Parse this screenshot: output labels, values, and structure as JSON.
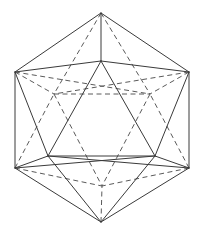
{
  "figure": {
    "type": "line-diagram",
    "canvas": {
      "width": 203,
      "height": 236,
      "background": "#ffffff"
    },
    "style": {
      "solid_color": "#3a3a3a",
      "dashed_color": "#5a5a5a",
      "stroke_width": 1,
      "dash_pattern": "5 3.5"
    },
    "vertices": {
      "outer_top_apex": {
        "x": 101,
        "y": 13
      },
      "outer_upper_left": {
        "x": 15,
        "y": 72
      },
      "outer_upper_right": {
        "x": 189,
        "y": 72
      },
      "outer_lower_left": {
        "x": 15,
        "y": 168
      },
      "outer_lower_right": {
        "x": 189,
        "y": 168
      },
      "outer_bottom_apex": {
        "x": 101,
        "y": 222
      },
      "inner_front_top": {
        "x": 101,
        "y": 61
      },
      "inner_front_left": {
        "x": 48,
        "y": 156
      },
      "inner_front_right": {
        "x": 155,
        "y": 156
      },
      "inner_back_left": {
        "x": 54,
        "y": 94
      },
      "inner_back_right": {
        "x": 150,
        "y": 94
      },
      "inner_back_bottom": {
        "x": 102,
        "y": 186
      }
    },
    "edges_solid": [
      {
        "name": "outer-hex-top-left",
        "x1": 101,
        "y1": 13,
        "x2": 15,
        "y2": 72
      },
      {
        "name": "outer-hex-top-right",
        "x1": 101,
        "y1": 13,
        "x2": 189,
        "y2": 72
      },
      {
        "name": "outer-hex-left",
        "x1": 15,
        "y1": 72,
        "x2": 15,
        "y2": 168
      },
      {
        "name": "outer-hex-right",
        "x1": 189,
        "y1": 72,
        "x2": 189,
        "y2": 168
      },
      {
        "name": "outer-hex-bottom-left",
        "x1": 15,
        "y1": 168,
        "x2": 101,
        "y2": 222
      },
      {
        "name": "outer-hex-bottom-right",
        "x1": 189,
        "y1": 168,
        "x2": 101,
        "y2": 222
      },
      {
        "name": "front-tri-left",
        "x1": 101,
        "y1": 61,
        "x2": 48,
        "y2": 156
      },
      {
        "name": "front-tri-right",
        "x1": 101,
        "y1": 61,
        "x2": 155,
        "y2": 156
      },
      {
        "name": "front-tri-base",
        "x1": 48,
        "y1": 156,
        "x2": 155,
        "y2": 156
      },
      {
        "name": "apex-to-front-top",
        "x1": 101,
        "y1": 13,
        "x2": 101,
        "y2": 61
      },
      {
        "name": "upperleft-to-front-top",
        "x1": 15,
        "y1": 72,
        "x2": 101,
        "y2": 61
      },
      {
        "name": "upperright-to-front-top",
        "x1": 189,
        "y1": 72,
        "x2": 101,
        "y2": 61
      },
      {
        "name": "upperleft-to-front-left",
        "x1": 15,
        "y1": 72,
        "x2": 48,
        "y2": 156
      },
      {
        "name": "upperright-to-front-right",
        "x1": 189,
        "y1": 72,
        "x2": 155,
        "y2": 156
      },
      {
        "name": "lowerleft-to-front-left",
        "x1": 15,
        "y1": 168,
        "x2": 48,
        "y2": 156
      },
      {
        "name": "lowerright-to-front-right",
        "x1": 189,
        "y1": 168,
        "x2": 155,
        "y2": 156
      },
      {
        "name": "lowerleft-to-front-right",
        "x1": 15,
        "y1": 168,
        "x2": 155,
        "y2": 156
      },
      {
        "name": "lowerright-to-front-left",
        "x1": 189,
        "y1": 168,
        "x2": 48,
        "y2": 156
      },
      {
        "name": "bottomapex-to-front-left",
        "x1": 101,
        "y1": 222,
        "x2": 48,
        "y2": 156
      },
      {
        "name": "bottomapex-to-front-right",
        "x1": 101,
        "y1": 222,
        "x2": 155,
        "y2": 156
      }
    ],
    "edges_dashed": [
      {
        "name": "back-tri-top",
        "x1": 54,
        "y1": 94,
        "x2": 150,
        "y2": 94
      },
      {
        "name": "back-tri-left",
        "x1": 54,
        "y1": 94,
        "x2": 102,
        "y2": 186
      },
      {
        "name": "back-tri-right",
        "x1": 150,
        "y1": 94,
        "x2": 102,
        "y2": 186
      },
      {
        "name": "apex-to-back-left",
        "x1": 101,
        "y1": 13,
        "x2": 54,
        "y2": 94
      },
      {
        "name": "apex-to-back-right",
        "x1": 101,
        "y1": 13,
        "x2": 150,
        "y2": 94
      },
      {
        "name": "upperleft-to-back-left",
        "x1": 15,
        "y1": 72,
        "x2": 54,
        "y2": 94
      },
      {
        "name": "upperright-to-back-right",
        "x1": 189,
        "y1": 72,
        "x2": 150,
        "y2": 94
      },
      {
        "name": "upperleft-to-back-right",
        "x1": 15,
        "y1": 72,
        "x2": 150,
        "y2": 94
      },
      {
        "name": "upperright-to-back-left",
        "x1": 189,
        "y1": 72,
        "x2": 54,
        "y2": 94
      },
      {
        "name": "lowerleft-to-back-left",
        "x1": 15,
        "y1": 168,
        "x2": 54,
        "y2": 94
      },
      {
        "name": "lowerright-to-back-right",
        "x1": 189,
        "y1": 168,
        "x2": 150,
        "y2": 94
      },
      {
        "name": "lowerleft-to-back-bottom",
        "x1": 15,
        "y1": 168,
        "x2": 102,
        "y2": 186
      },
      {
        "name": "lowerright-to-back-bottom",
        "x1": 189,
        "y1": 168,
        "x2": 102,
        "y2": 186
      },
      {
        "name": "bottomapex-to-back-bottom",
        "x1": 101,
        "y1": 222,
        "x2": 102,
        "y2": 186
      }
    ]
  }
}
